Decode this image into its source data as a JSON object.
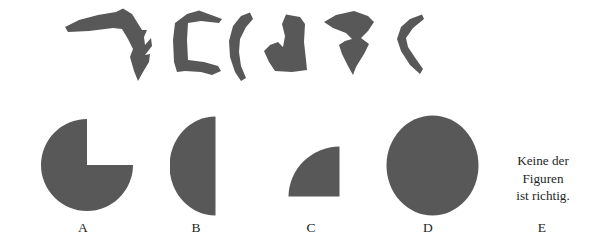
{
  "item": {
    "type": "figure-assembly-multiple-choice",
    "language": "de",
    "fill_color": "#585858",
    "background_color": "#ffffff",
    "text_color": "#231f1e"
  },
  "pieces": {
    "count": 6,
    "description": "Sechs Teilstücke, die zusammengesetzt werden sollen",
    "items": [
      {
        "id": "piece-1",
        "name": "piece-hook"
      },
      {
        "id": "piece-2",
        "name": "piece-bracket"
      },
      {
        "id": "piece-3",
        "name": "piece-crescent"
      },
      {
        "id": "piece-4",
        "name": "piece-blob"
      },
      {
        "id": "piece-5",
        "name": "piece-arrow"
      },
      {
        "id": "piece-6",
        "name": "piece-sliver"
      }
    ]
  },
  "options": {
    "items": [
      {
        "id": "option-a",
        "label": "A",
        "figure": "circle-with-upper-right-quadrant-removed"
      },
      {
        "id": "option-b",
        "label": "B",
        "figure": "left-semicircle"
      },
      {
        "id": "option-c",
        "label": "C",
        "figure": "quarter-circle-arc-upper-left"
      },
      {
        "id": "option-d",
        "label": "D",
        "figure": "full-circle"
      },
      {
        "id": "option-e",
        "label": "E",
        "figure": "text-none-of-the-figures",
        "text_lines": [
          "Keine der",
          "Figuren",
          "ist richtig."
        ]
      }
    ]
  }
}
